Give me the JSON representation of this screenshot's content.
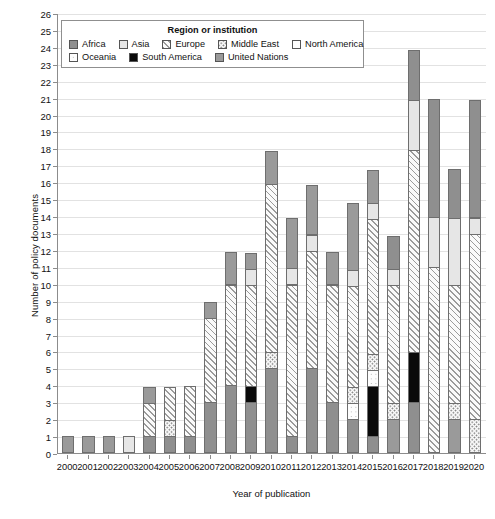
{
  "chart_data": {
    "type": "bar",
    "subtype": "stacked-vertical",
    "title": "",
    "xlabel": "Year of publication",
    "ylabel": "Number of policy documents",
    "ylim": [
      0,
      26
    ],
    "ytick_step": 1,
    "grid": true,
    "legend_position": "top-inside",
    "legend_title": "Region or institution",
    "categories": [
      "2000",
      "2001",
      "2002",
      "2003",
      "2004",
      "2005",
      "2006",
      "2007",
      "2008",
      "2009",
      "2010",
      "2011",
      "2012",
      "2013",
      "2014",
      "2015",
      "2016",
      "2017",
      "2018",
      "2019",
      "2020"
    ],
    "series": [
      {
        "name": "Africa",
        "pattern": "solid-gray",
        "color": "#8f8f8f",
        "values": [
          0,
          0,
          0,
          0,
          1,
          1,
          1,
          3,
          4,
          3,
          0,
          0,
          0,
          0,
          2,
          1,
          0,
          3,
          0,
          0,
          0
        ]
      },
      {
        "name": "South America",
        "pattern": "solid-black",
        "color": "#0a0a0a",
        "values": [
          0,
          0,
          0,
          0,
          0,
          0,
          0,
          0,
          0,
          1,
          0,
          0,
          0,
          0,
          0,
          3,
          0,
          3,
          0,
          0,
          0
        ]
      },
      {
        "name": "United Nations",
        "pattern": "solid-dark-gray",
        "color": "#9a9a9a",
        "values": [
          1,
          1,
          1,
          0,
          1,
          0,
          0,
          1,
          2,
          1,
          2,
          3,
          3,
          3,
          1,
          1,
          2,
          0,
          0,
          2,
          1
        ]
      },
      {
        "name": "Oceania",
        "pattern": "fine-dots",
        "color": "#fdfdfd",
        "values": [
          0,
          0,
          0,
          1,
          0,
          0,
          0,
          0,
          0,
          0,
          0,
          0,
          0,
          0,
          0,
          1,
          1,
          0,
          0,
          1,
          0
        ]
      },
      {
        "name": "Middle East",
        "pattern": "coarse-dots",
        "color": "#fbfbfb",
        "values": [
          0,
          0,
          0,
          0,
          0,
          1,
          0,
          0,
          0,
          0,
          1,
          0,
          0,
          0,
          1,
          1,
          1,
          0,
          0,
          1,
          1
        ]
      },
      {
        "name": "Europe",
        "pattern": "diagonal-hatch",
        "color": "#fafafa",
        "values": [
          0,
          0,
          0,
          0,
          2,
          2,
          3,
          5,
          6,
          6,
          10,
          9,
          7,
          7,
          6,
          8,
          7,
          12,
          11,
          8,
          11
        ]
      },
      {
        "name": "North America",
        "pattern": "open-white",
        "color": "#fdfdfd",
        "values": [
          0,
          0,
          0,
          0,
          0,
          0,
          0,
          0,
          0,
          0,
          0,
          0,
          0,
          0,
          0,
          0,
          0,
          0,
          0,
          0,
          0
        ]
      },
      {
        "name": "Asia",
        "pattern": "light-gray",
        "color": "#e6e6e6",
        "values": [
          0,
          0,
          0,
          0,
          0,
          0,
          0,
          0,
          0,
          1,
          0,
          1,
          1,
          0,
          1,
          1,
          2,
          3,
          2,
          2,
          1
        ]
      }
    ],
    "stack_order": [
      "Africa",
      "South America",
      "United Nations",
      "Oceania",
      "Middle East",
      "Europe",
      "North America",
      "Asia",
      "Africa_top"
    ],
    "totals": [
      1,
      1,
      1,
      1,
      4,
      4,
      4,
      9,
      12,
      12,
      18,
      14,
      16,
      12,
      15,
      17,
      13,
      24,
      21,
      17,
      21
    ],
    "bar_stacks": [
      {
        "year": "2000",
        "segments": [
          {
            "series": "United Nations",
            "value": 1
          }
        ]
      },
      {
        "year": "2001",
        "segments": [
          {
            "series": "United Nations",
            "value": 1
          }
        ]
      },
      {
        "year": "2002",
        "segments": [
          {
            "series": "United Nations",
            "value": 1
          }
        ]
      },
      {
        "year": "2003",
        "segments": [
          {
            "series": "Asia",
            "value": 1
          }
        ]
      },
      {
        "year": "2004",
        "segments": [
          {
            "series": "Africa",
            "value": 1
          },
          {
            "series": "Europe",
            "value": 2
          },
          {
            "series": "United Nations",
            "value": 1
          }
        ]
      },
      {
        "year": "2005",
        "segments": [
          {
            "series": "Africa",
            "value": 1
          },
          {
            "series": "Middle East",
            "value": 1
          },
          {
            "series": "Europe",
            "value": 2
          }
        ]
      },
      {
        "year": "2006",
        "segments": [
          {
            "series": "Africa",
            "value": 1
          },
          {
            "series": "Europe",
            "value": 3
          }
        ]
      },
      {
        "year": "2007",
        "segments": [
          {
            "series": "Africa",
            "value": 3
          },
          {
            "series": "Europe",
            "value": 5
          },
          {
            "series": "United Nations",
            "value": 1
          }
        ]
      },
      {
        "year": "2008",
        "segments": [
          {
            "series": "Africa",
            "value": 4
          },
          {
            "series": "Europe",
            "value": 6
          },
          {
            "series": "United Nations",
            "value": 2
          }
        ]
      },
      {
        "year": "2009",
        "segments": [
          {
            "series": "Africa",
            "value": 3
          },
          {
            "series": "South America",
            "value": 1
          },
          {
            "series": "Europe",
            "value": 6
          },
          {
            "series": "Asia",
            "value": 1
          },
          {
            "series": "United Nations",
            "value": 1
          }
        ]
      },
      {
        "year": "2010",
        "segments": [
          {
            "series": "Africa",
            "value": 5
          },
          {
            "series": "Middle East",
            "value": 1
          },
          {
            "series": "Europe",
            "value": 10
          },
          {
            "series": "United Nations",
            "value": 2
          }
        ]
      },
      {
        "year": "2011",
        "segments": [
          {
            "series": "Africa",
            "value": 1
          },
          {
            "series": "Europe",
            "value": 9
          },
          {
            "series": "Asia",
            "value": 1
          },
          {
            "series": "United Nations",
            "value": 3
          }
        ]
      },
      {
        "year": "2012",
        "segments": [
          {
            "series": "Africa",
            "value": 5
          },
          {
            "series": "Europe",
            "value": 7
          },
          {
            "series": "Asia",
            "value": 1
          },
          {
            "series": "United Nations",
            "value": 3
          }
        ]
      },
      {
        "year": "2013",
        "segments": [
          {
            "series": "Africa",
            "value": 3
          },
          {
            "series": "Europe",
            "value": 7
          },
          {
            "series": "United Nations",
            "value": 2
          }
        ]
      },
      {
        "year": "2014",
        "segments": [
          {
            "series": "Africa",
            "value": 2
          },
          {
            "series": "Oceania",
            "value": 1
          },
          {
            "series": "Middle East",
            "value": 1
          },
          {
            "series": "Europe",
            "value": 6
          },
          {
            "series": "Asia",
            "value": 1
          },
          {
            "series": "United Nations",
            "value": 4
          }
        ]
      },
      {
        "year": "2015",
        "segments": [
          {
            "series": "Africa",
            "value": 1
          },
          {
            "series": "South America",
            "value": 3
          },
          {
            "series": "Oceania",
            "value": 1
          },
          {
            "series": "Middle East",
            "value": 1
          },
          {
            "series": "Europe",
            "value": 8
          },
          {
            "series": "Asia",
            "value": 1
          },
          {
            "series": "United Nations",
            "value": 2
          }
        ]
      },
      {
        "year": "2016",
        "segments": [
          {
            "series": "United Nations",
            "value": 2
          },
          {
            "series": "Middle East",
            "value": 1
          },
          {
            "series": "Europe",
            "value": 7
          },
          {
            "series": "Asia",
            "value": 1
          },
          {
            "series": "Africa",
            "value": 2
          }
        ]
      },
      {
        "year": "2017",
        "segments": [
          {
            "series": "Africa",
            "value": 3
          },
          {
            "series": "South America",
            "value": 3
          },
          {
            "series": "Europe",
            "value": 12
          },
          {
            "series": "Asia",
            "value": 3
          },
          {
            "series": "Africa_top",
            "value": 3
          }
        ]
      },
      {
        "year": "2018",
        "segments": [
          {
            "series": "Europe",
            "value": 11
          },
          {
            "series": "Asia",
            "value": 3
          },
          {
            "series": "Africa_top",
            "value": 7
          }
        ]
      },
      {
        "year": "2019",
        "segments": [
          {
            "series": "United Nations",
            "value": 2
          },
          {
            "series": "Middle East",
            "value": 1
          },
          {
            "series": "Europe",
            "value": 7
          },
          {
            "series": "Asia",
            "value": 4
          },
          {
            "series": "Africa_top",
            "value": 3
          }
        ]
      },
      {
        "year": "2020",
        "segments": [
          {
            "series": "Middle East",
            "value": 2
          },
          {
            "series": "Europe",
            "value": 11
          },
          {
            "series": "Asia",
            "value": 1
          },
          {
            "series": "Africa_top",
            "value": 7
          }
        ]
      }
    ],
    "ytick_labels": [
      "0",
      "1",
      "2",
      "3",
      "4",
      "5",
      "6",
      "7",
      "8",
      "9",
      "10",
      "11",
      "12",
      "13",
      "14",
      "15",
      "16",
      "17",
      "18",
      "19",
      "20",
      "21",
      "22",
      "23",
      "24",
      "25",
      "26"
    ]
  },
  "legend": {
    "title": "Region or institution",
    "rows": [
      [
        {
          "label": "Africa",
          "swatch": "africa-swatch"
        },
        {
          "label": "Asia",
          "swatch": "asia-swatch"
        },
        {
          "label": "Europe",
          "swatch": "europe-swatch"
        },
        {
          "label": "Middle East",
          "swatch": "middle-east-swatch"
        },
        {
          "label": "North America",
          "swatch": "north-america-swatch"
        }
      ],
      [
        {
          "label": "Oceania",
          "swatch": "oceania-swatch"
        },
        {
          "label": "South America",
          "swatch": "south-america-swatch"
        },
        {
          "label": "United Nations",
          "swatch": "united-nations-swatch"
        }
      ]
    ]
  },
  "axes": {
    "x_title": "Year of publication",
    "y_title": "Number of policy documents"
  },
  "colors": {
    "africa": "#8f8f8f",
    "asia": "#e6e6e6",
    "europe": "#fafafa",
    "middle_east": "#fbfbfb",
    "north_america": "#fdfdfd",
    "oceania": "#fdfdfd",
    "south_america": "#0a0a0a",
    "united_nations": "#9a9a9a",
    "grid": "#e2e2e2",
    "axis": "#8c8c8c"
  }
}
